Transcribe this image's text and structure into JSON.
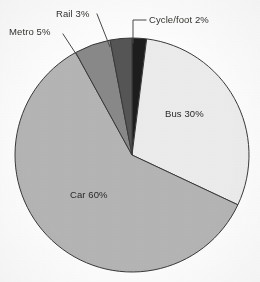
{
  "chart_data": {
    "type": "pie",
    "title": "",
    "subtitle": "",
    "xlabel": "",
    "ylabel": "",
    "legend_position": "none",
    "grid": false,
    "units": "percent",
    "total": 100,
    "categories": [
      "Bus",
      "Car",
      "Metro",
      "Rail",
      "Cycle/foot"
    ],
    "values": [
      30,
      60,
      5,
      3,
      2
    ],
    "slices": [
      {
        "name": "Cycle/foot",
        "label": "Cycle/foot 2%",
        "value": 2,
        "color": "#1d1d1d",
        "label_placement": "outside",
        "leader": "elbow"
      },
      {
        "name": "Bus",
        "label": "Bus 30%",
        "value": 30,
        "color": "#eeeeee",
        "label_placement": "inside",
        "leader": "none"
      },
      {
        "name": "Car",
        "label": "Car 60%",
        "value": 60,
        "color": "#b6b6b6",
        "label_placement": "inside",
        "leader": "none"
      },
      {
        "name": "Metro",
        "label": "Metro 5%",
        "value": 5,
        "color": "#8a8a8a",
        "label_placement": "outside",
        "leader": "diagonal"
      },
      {
        "name": "Rail",
        "label": "Rail 3%",
        "value": 3,
        "color": "#565656",
        "label_placement": "outside",
        "leader": "diagonal"
      }
    ],
    "labels": {
      "bus": "Bus 30%",
      "car": "Car 60%",
      "metro": "Metro 5%",
      "rail": "Rail 3%",
      "cycle_foot": "Cycle/foot 2%"
    },
    "colors": {
      "background": "#ffffff",
      "outline": "#3a3a3a",
      "text": "#33332f",
      "bus": "#eeeeee",
      "car": "#b6b6b6",
      "metro": "#8a8a8a",
      "rail": "#565656",
      "cycle_foot": "#1d1d1d"
    }
  }
}
